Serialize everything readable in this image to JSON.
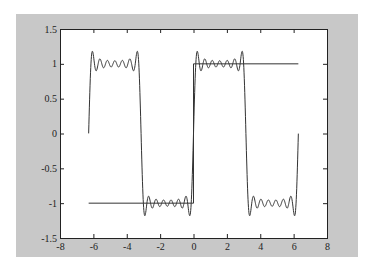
{
  "chart_data": {
    "type": "line",
    "title": "",
    "xlabel": "",
    "ylabel": "",
    "xlim": [
      -8,
      8
    ],
    "ylim": [
      -1.5,
      1.5
    ],
    "grid": false,
    "legend": null,
    "x_ticks": [
      -8,
      -6,
      -4,
      -2,
      0,
      2,
      4,
      6,
      8
    ],
    "x_tick_labels": [
      "-8",
      "-6",
      "-4",
      "-2",
      "0",
      "2",
      "4",
      "6",
      "8"
    ],
    "y_ticks": [
      -1.5,
      -1,
      -0.5,
      0,
      0.5,
      1,
      1.5
    ],
    "y_tick_labels": [
      "-1.5",
      "-1",
      "-0.5",
      "0",
      "0.5",
      "1",
      "1.5"
    ],
    "series": [
      {
        "name": "square-wave-reference",
        "description": "Step reference: y=-1 on [-2π,0], vertical at x=0, y=1 on [0,2π]",
        "x": [
          -6.283,
          0,
          0,
          6.283
        ],
        "y": [
          -1,
          -1,
          1,
          1
        ],
        "color": "#333333"
      },
      {
        "name": "fourier-partial-sum",
        "description": "Partial Fourier sum of square wave sign(sin x), odd harmonics 1..13, showing Gibbs overshoot ≈1.18",
        "x_range": [
          -6.283,
          6.283
        ],
        "harmonics": [
          1,
          3,
          5,
          7,
          9,
          11,
          13
        ],
        "overshoot_peak": 1.18,
        "color": "#333333"
      }
    ]
  },
  "colors": {
    "figure_bg": "#c8c8c8",
    "axes_bg": "#ffffff",
    "line": "#333333",
    "axis": "#222222"
  }
}
